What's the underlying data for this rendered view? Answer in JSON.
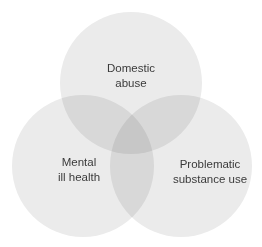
{
  "diagram": {
    "type": "venn",
    "sets": [
      {
        "id": "top",
        "label": "Domestic\nabuse",
        "cx": 131,
        "cy": 83,
        "r": 71
      },
      {
        "id": "left",
        "label": "Mental\nill health",
        "cx": 83,
        "cy": 166,
        "r": 71
      },
      {
        "id": "right",
        "label": "Problematic\nsubstance use",
        "cx": 181,
        "cy": 166,
        "r": 71
      }
    ],
    "colors": {
      "fill": "#d2d2d2",
      "fill_opacity": 0.5,
      "text": "#3a3a3a",
      "background": "#ffffff"
    }
  }
}
